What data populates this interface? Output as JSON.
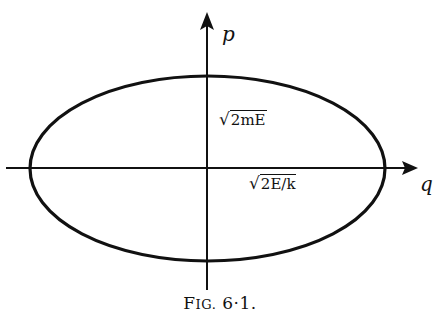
{
  "diagram": {
    "axes": {
      "vertical_label": "p",
      "horizontal_label": "q"
    },
    "annotations": {
      "p_intercept_label": "√2mE",
      "p_intercept_radicand": "2mE",
      "q_intercept_label": "√2E/k",
      "q_intercept_radicand": "2E/k"
    },
    "caption": {
      "prefix_first": "F",
      "prefix_rest": "IG.",
      "number": "6·1."
    },
    "colors": {
      "ink": "#111111",
      "background": "#ffffff"
    }
  }
}
